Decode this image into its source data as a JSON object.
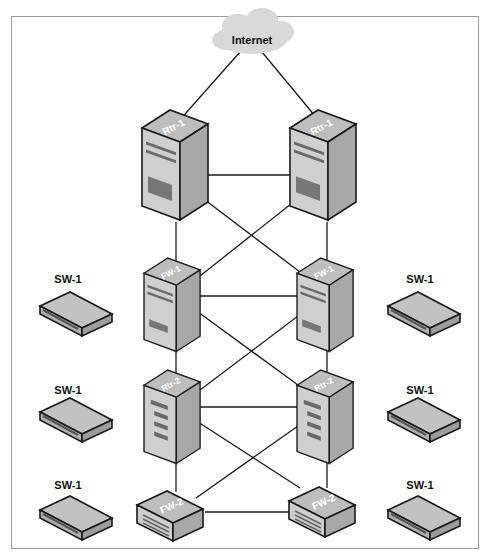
{
  "diagram": {
    "type": "network-topology",
    "cloud": {
      "label": "Internet"
    },
    "routers_top": [
      {
        "label": "Rtr-1"
      },
      {
        "label": "Rtr-1"
      }
    ],
    "firewalls_top": [
      {
        "label": "FW-1"
      },
      {
        "label": "FW-1"
      }
    ],
    "routers_mid": [
      {
        "label": "Rtr-2"
      },
      {
        "label": "Rtr-2"
      }
    ],
    "firewalls_bottom": [
      {
        "label": "FW-2"
      },
      {
        "label": "FW-2"
      }
    ],
    "switches_left": [
      {
        "label": "SW-1"
      },
      {
        "label": "SW-1"
      },
      {
        "label": "SW-1"
      }
    ],
    "switches_right": [
      {
        "label": "SW-1"
      },
      {
        "label": "SW-1"
      },
      {
        "label": "SW-1"
      }
    ],
    "colors": {
      "line": "#1a1a1a",
      "device_face": "#c8c8c8",
      "device_side": "#a9a9a9",
      "device_top": "#b8b8b8",
      "cloud": "#d6d6d6",
      "frame": "#9a9a9a"
    }
  }
}
